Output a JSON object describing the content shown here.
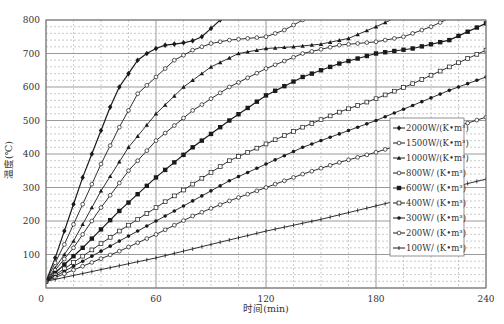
{
  "chart_data": {
    "type": "line",
    "title": "",
    "xlabel": "时间(min)",
    "ylabel": "温度(℃)",
    "xlim": [
      0,
      240
    ],
    "ylim": [
      0,
      800
    ],
    "xticks": [
      0,
      60,
      120,
      180,
      240
    ],
    "yticks": [
      100,
      200,
      300,
      400,
      500,
      600,
      700,
      800
    ],
    "x_minor_step": 15,
    "y_minor_step": 20,
    "grid": true,
    "legend_position": "lower right (inside)",
    "series": [
      {
        "name": "2000W/(K·m³)",
        "marker": "filled-diamond",
        "points": [
          [
            0,
            20
          ],
          [
            5,
            90
          ],
          [
            10,
            170
          ],
          [
            15,
            250
          ],
          [
            20,
            330
          ],
          [
            25,
            400
          ],
          [
            30,
            470
          ],
          [
            35,
            540
          ],
          [
            40,
            600
          ],
          [
            45,
            640
          ],
          [
            50,
            680
          ],
          [
            55,
            700
          ],
          [
            60,
            715
          ],
          [
            65,
            725
          ],
          [
            70,
            728
          ],
          [
            75,
            732
          ],
          [
            80,
            738
          ],
          [
            85,
            750
          ],
          [
            90,
            775
          ],
          [
            95,
            800
          ]
        ]
      },
      {
        "name": "1500W/(K·m³)",
        "marker": "open-circle",
        "points": [
          [
            0,
            20
          ],
          [
            10,
            130
          ],
          [
            20,
            250
          ],
          [
            30,
            370
          ],
          [
            40,
            480
          ],
          [
            50,
            580
          ],
          [
            60,
            630
          ],
          [
            70,
            680
          ],
          [
            80,
            710
          ],
          [
            90,
            730
          ],
          [
            100,
            740
          ],
          [
            110,
            745
          ],
          [
            120,
            750
          ],
          [
            130,
            770
          ],
          [
            140,
            800
          ]
        ]
      },
      {
        "name": "1000W/(K·m³)",
        "marker": "filled-triangle",
        "points": [
          [
            0,
            20
          ],
          [
            15,
            140
          ],
          [
            30,
            290
          ],
          [
            45,
            420
          ],
          [
            60,
            520
          ],
          [
            75,
            600
          ],
          [
            90,
            660
          ],
          [
            105,
            700
          ],
          [
            120,
            715
          ],
          [
            135,
            720
          ],
          [
            150,
            728
          ],
          [
            165,
            745
          ],
          [
            180,
            780
          ],
          [
            188,
            800
          ]
        ]
      },
      {
        "name": "800W/(K·m³)",
        "marker": "open-circle",
        "points": [
          [
            0,
            20
          ],
          [
            15,
            120
          ],
          [
            30,
            240
          ],
          [
            45,
            350
          ],
          [
            60,
            440
          ],
          [
            80,
            530
          ],
          [
            100,
            600
          ],
          [
            120,
            655
          ],
          [
            140,
            700
          ],
          [
            160,
            725
          ],
          [
            180,
            735
          ],
          [
            195,
            750
          ],
          [
            210,
            780
          ],
          [
            218,
            800
          ]
        ]
      },
      {
        "name": "600W/(K·m³)",
        "marker": "filled-square",
        "points": [
          [
            0,
            20
          ],
          [
            20,
            120
          ],
          [
            40,
            230
          ],
          [
            60,
            330
          ],
          [
            80,
            420
          ],
          [
            100,
            500
          ],
          [
            120,
            575
          ],
          [
            140,
            630
          ],
          [
            160,
            670
          ],
          [
            180,
            700
          ],
          [
            200,
            715
          ],
          [
            220,
            740
          ],
          [
            240,
            790
          ]
        ]
      },
      {
        "name": "400W/(K·m³)",
        "marker": "open-square",
        "points": [
          [
            0,
            20
          ],
          [
            20,
            95
          ],
          [
            40,
            170
          ],
          [
            60,
            240
          ],
          [
            80,
            310
          ],
          [
            100,
            380
          ],
          [
            120,
            430
          ],
          [
            140,
            480
          ],
          [
            160,
            525
          ],
          [
            180,
            565
          ],
          [
            200,
            610
          ],
          [
            220,
            660
          ],
          [
            240,
            710
          ]
        ]
      },
      {
        "name": "300W/(K·m³)",
        "marker": "filled-circle",
        "points": [
          [
            0,
            20
          ],
          [
            20,
            80
          ],
          [
            40,
            140
          ],
          [
            60,
            200
          ],
          [
            80,
            260
          ],
          [
            100,
            320
          ],
          [
            120,
            370
          ],
          [
            140,
            420
          ],
          [
            160,
            460
          ],
          [
            180,
            500
          ],
          [
            200,
            545
          ],
          [
            220,
            590
          ],
          [
            240,
            630
          ]
        ]
      },
      {
        "name": "200W/(K·m³)",
        "marker": "open-circle",
        "points": [
          [
            0,
            20
          ],
          [
            20,
            65
          ],
          [
            40,
            110
          ],
          [
            60,
            160
          ],
          [
            80,
            215
          ],
          [
            100,
            260
          ],
          [
            120,
            300
          ],
          [
            140,
            340
          ],
          [
            160,
            375
          ],
          [
            180,
            405
          ],
          [
            200,
            440
          ],
          [
            220,
            475
          ],
          [
            240,
            510
          ]
        ]
      },
      {
        "name": "100W/(K·m³)",
        "marker": "cross",
        "points": [
          [
            0,
            20
          ],
          [
            30,
            55
          ],
          [
            60,
            90
          ],
          [
            90,
            130
          ],
          [
            120,
            170
          ],
          [
            150,
            205
          ],
          [
            180,
            245
          ],
          [
            210,
            285
          ],
          [
            240,
            325
          ]
        ]
      }
    ]
  },
  "legend": {
    "items": [
      "2000W/(K•m³)",
      "1500W/(K•m³)",
      "1000W/(K•m³)",
      "800W/ (K•m³)",
      "600W/ (K•m³)",
      "400W/ (K•m³)",
      "300W/ (K•m³)",
      "200W/ (K•m³)",
      "100W/ (K•m³)"
    ]
  },
  "colors": {
    "line": "#1a1a1a",
    "major_grid": "#9a9a9a",
    "minor_grid": "#b5b5b5",
    "text": "#333333"
  }
}
